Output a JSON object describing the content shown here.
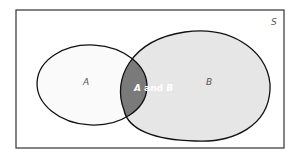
{
  "diagram": {
    "type": "venn",
    "universe": {
      "label": "S"
    },
    "sets": [
      {
        "id": "A",
        "label": "A",
        "fill": "#fafafa"
      },
      {
        "id": "B",
        "label": "B",
        "fill": "#e6e6e6"
      }
    ],
    "intersection": {
      "label_parts": [
        "A",
        " and ",
        "B"
      ],
      "fill": "#7a7a7a",
      "text_color": "#ffffff"
    },
    "colors": {
      "stroke": "#111111",
      "universe_border": "#333333",
      "background": "#ffffff",
      "label": "#555555"
    }
  }
}
